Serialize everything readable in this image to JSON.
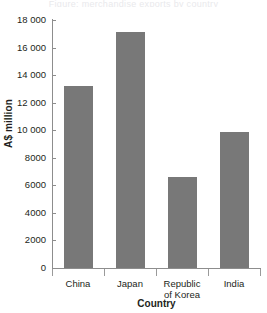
{
  "caption": {
    "text": "Figure: merchandise exports by country"
  },
  "chart_data": {
    "type": "bar",
    "title": "",
    "xlabel": "Country",
    "ylabel": "A$ million",
    "categories": [
      "China",
      "Japan",
      "Republic of Korea",
      "India"
    ],
    "category_lines": [
      [
        "China"
      ],
      [
        "Japan"
      ],
      [
        "Republic",
        "of Korea"
      ],
      [
        "India"
      ]
    ],
    "values": [
      13200,
      17100,
      6600,
      9900
    ],
    "ylim": [
      0,
      18000
    ],
    "ytick_step": 2000,
    "ytick_labels": [
      "18 000",
      "16 000",
      "14 000",
      "12 000",
      "10 000",
      "8000",
      "6000",
      "4000",
      "2000",
      "0"
    ],
    "ytick_values": [
      18000,
      16000,
      14000,
      12000,
      10000,
      8000,
      6000,
      4000,
      2000,
      0
    ],
    "grid": false,
    "legend": false,
    "bar_color": "#787878",
    "axis_color": "#8d8d8d",
    "text_color": "#231f20"
  }
}
